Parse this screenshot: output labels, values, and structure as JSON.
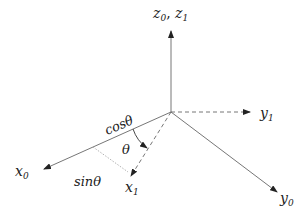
{
  "diagram": {
    "labels": {
      "z": "z",
      "z_sub0": "0",
      "z_sep": ", ",
      "z1": "z",
      "z_sub1": "1",
      "y1": "y",
      "y1_sub": "1",
      "y0": "y",
      "y0_sub": "0",
      "x0": "x",
      "x0_sub": "0",
      "x1": "x",
      "x1_sub": "1",
      "cos": "cosθ",
      "sin": "sinθ",
      "theta": "θ"
    },
    "colors": {
      "axis": "#555555",
      "dotted": "#aaaaaa",
      "text": "#222222"
    }
  }
}
